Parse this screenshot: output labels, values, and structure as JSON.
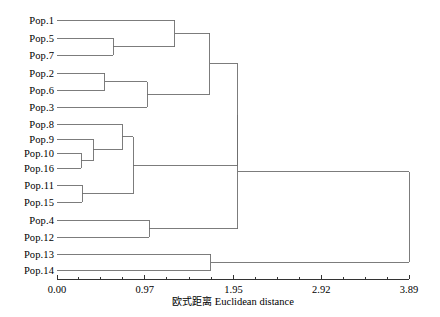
{
  "chart_data": {
    "type": "tree",
    "title": "",
    "xlabel_cn": "欧式距离",
    "xlabel_en": "Euclidean distance",
    "ylabel": "",
    "grid": false,
    "legend": "none",
    "line_color": "#6e6e6e",
    "text_color": "#000000",
    "background": "#ffffff",
    "xlim": [
      0.0,
      3.89
    ],
    "xticks": [
      0.0,
      0.97,
      1.95,
      2.92,
      3.89
    ],
    "xtick_labels": [
      "0.00",
      "0.97",
      "1.95",
      "2.92",
      "3.89"
    ],
    "minor_ticks_per_interval": 4,
    "leaves": [
      {
        "label": "Pop.1",
        "order": 0,
        "y": 20
      },
      {
        "label": "Pop.5",
        "order": 1,
        "y": 38
      },
      {
        "label": "Pop.7",
        "order": 2,
        "y": 55
      },
      {
        "label": "Pop.2",
        "order": 3,
        "y": 73
      },
      {
        "label": "Pop.6",
        "order": 4,
        "y": 90
      },
      {
        "label": "Pop.3",
        "order": 5,
        "y": 107
      },
      {
        "label": "Pop.8",
        "order": 6,
        "y": 124
      },
      {
        "label": "Pop.9",
        "order": 7,
        "y": 139
      },
      {
        "label": "Pop.10",
        "order": 8,
        "y": 153
      },
      {
        "label": "Pop.16",
        "order": 9,
        "y": 168
      },
      {
        "label": "Pop.11",
        "order": 10,
        "y": 185
      },
      {
        "label": "Pop.15",
        "order": 11,
        "y": 202
      },
      {
        "label": "Pop.4",
        "order": 12,
        "y": 220
      },
      {
        "label": "Pop.12",
        "order": 13,
        "y": 237
      },
      {
        "label": "Pop.13",
        "order": 14,
        "y": 254
      },
      {
        "label": "Pop.14",
        "order": 15,
        "y": 270
      }
    ],
    "merges": [
      {
        "id": "m1",
        "children": [
          "Pop.5",
          "Pop.7"
        ],
        "distance": 0.62,
        "y": 46.5
      },
      {
        "id": "m2",
        "children": [
          "Pop.1",
          "m1"
        ],
        "distance": 1.3,
        "y": 33.2
      },
      {
        "id": "m3",
        "children": [
          "Pop.2",
          "Pop.6"
        ],
        "distance": 0.53,
        "y": 81.5
      },
      {
        "id": "m4",
        "children": [
          "m3",
          "Pop.3"
        ],
        "distance": 1.0,
        "y": 94.2
      },
      {
        "id": "m5",
        "children": [
          "m2",
          "m4"
        ],
        "distance": 1.69,
        "y": 63.7
      },
      {
        "id": "m6",
        "children": [
          "Pop.10",
          "Pop.16"
        ],
        "distance": 0.27,
        "y": 160.5
      },
      {
        "id": "m7",
        "children": [
          "Pop.9",
          "m6"
        ],
        "distance": 0.4,
        "y": 149.8
      },
      {
        "id": "m8",
        "children": [
          "Pop.8",
          "m7"
        ],
        "distance": 0.72,
        "y": 136.9
      },
      {
        "id": "m9",
        "children": [
          "Pop.11",
          "Pop.15"
        ],
        "distance": 0.28,
        "y": 193.5
      },
      {
        "id": "m10",
        "children": [
          "m8",
          "m9"
        ],
        "distance": 0.84,
        "y": 165.2
      },
      {
        "id": "m11",
        "children": [
          "m5",
          "m10"
        ],
        "distance": 2.0,
        "y": 114.5
      },
      {
        "id": "m12",
        "children": [
          "Pop.4",
          "Pop.12"
        ],
        "distance": 1.02,
        "y": 228.5
      },
      {
        "id": "m13",
        "children": [
          "m11",
          "m12"
        ],
        "distance": 2.0,
        "y": 171.5
      },
      {
        "id": "m14",
        "children": [
          "Pop.13",
          "Pop.14"
        ],
        "distance": 1.7,
        "y": 262.0
      },
      {
        "id": "m15",
        "children": [
          "m13",
          "m14"
        ],
        "distance": 3.89,
        "y": 216.8
      }
    ]
  },
  "geometry": {
    "axis_x0": 57,
    "axis_x1": 409,
    "axis_y": 279,
    "tick_len": 4,
    "minor_tick_len": 2.5,
    "label_right": 54,
    "tick_label_y": 284,
    "axis_title_x": 233,
    "axis_title_y": 293
  }
}
